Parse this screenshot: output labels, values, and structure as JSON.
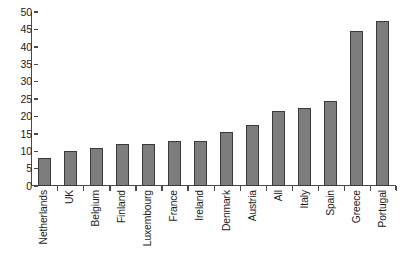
{
  "chart_data": {
    "type": "bar",
    "title": "",
    "subtitle": "",
    "xlabel": "",
    "ylabel": "",
    "categories": [
      "Netherlands",
      "UK",
      "Belgium",
      "Finland",
      "Luxembourg",
      "France",
      "Ireland",
      "Denmark",
      "Austria",
      "All",
      "Italy",
      "Spain",
      "Greece",
      "Portugal"
    ],
    "values": [
      8,
      10,
      11,
      12,
      12,
      13,
      13,
      15.5,
      17.5,
      21.5,
      22.5,
      24.5,
      44.5,
      47.5
    ],
    "ylim": [
      0,
      50
    ],
    "yticks": [
      0,
      5,
      10,
      15,
      20,
      25,
      30,
      35,
      40,
      45,
      50
    ],
    "ytick_labels": [
      "0",
      "5",
      "10",
      "15",
      "20",
      "25",
      "30",
      "35",
      "40",
      "45",
      "50"
    ],
    "grid": false,
    "legend": false,
    "legend_position": "none",
    "bar_color": "#7d7d7d",
    "bar_edge_color": "#3a3a3a",
    "axis_color": "#4a4a4a",
    "background_color": "#ffffff",
    "xtick_rotation": 90
  }
}
